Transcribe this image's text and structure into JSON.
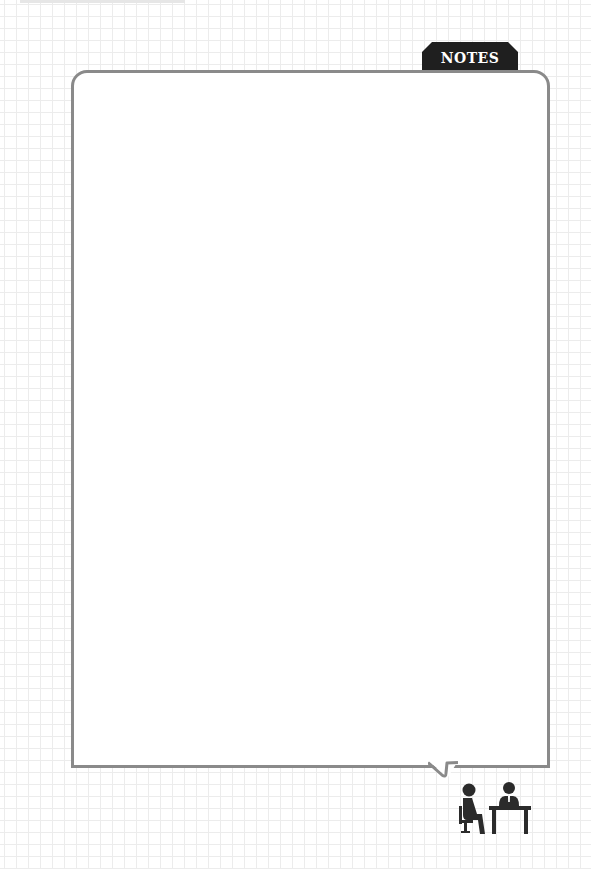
{
  "tab": {
    "label": "NOTES"
  },
  "note": {
    "value": "",
    "placeholder": ""
  },
  "colors": {
    "card_border": "#8a8a8a",
    "tab_background": "#1f1f1f",
    "tab_text": "#ffffff",
    "grid_line": "#ececec",
    "icon": "#2b2b2b"
  },
  "icons": {
    "footer": "interview-meeting-icon"
  }
}
